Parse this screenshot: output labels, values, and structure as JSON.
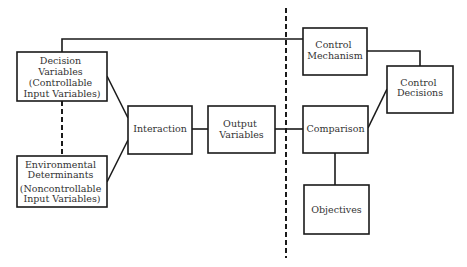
{
  "diagram": {
    "type": "block-diagram",
    "colors": {
      "line": "#1a1a1a",
      "text": "#333333",
      "background": "#ffffff"
    },
    "nodes": {
      "decision_variables": {
        "lines": [
          "Decision",
          "Variables",
          "(Controllable",
          "Input Variables)"
        ]
      },
      "environmental_determinants": {
        "lines": [
          "Environmental",
          "Determinants",
          "(Noncontrollable",
          "Input Variables)"
        ]
      },
      "interaction": {
        "lines": [
          "Interaction"
        ]
      },
      "output_variables": {
        "lines": [
          "Output",
          "Variables"
        ]
      },
      "control_mechanism": {
        "lines": [
          "Control",
          "Mechanism"
        ]
      },
      "control_decisions": {
        "lines": [
          "Control",
          "Decisions"
        ]
      },
      "comparison": {
        "lines": [
          "Comparison"
        ]
      },
      "objectives": {
        "lines": [
          "Objectives"
        ]
      }
    },
    "edges": [
      {
        "from": "decision_variables",
        "to": "control_mechanism",
        "style": "solid"
      },
      {
        "from": "decision_variables",
        "to": "environmental_determinants",
        "style": "dashed"
      },
      {
        "from": "decision_variables",
        "to": "interaction",
        "style": "solid"
      },
      {
        "from": "environmental_determinants",
        "to": "interaction",
        "style": "solid"
      },
      {
        "from": "interaction",
        "to": "output_variables",
        "style": "solid"
      },
      {
        "from": "output_variables",
        "to": "comparison",
        "style": "solid"
      },
      {
        "from": "comparison",
        "to": "objectives",
        "style": "solid"
      },
      {
        "from": "comparison",
        "to": "control_decisions",
        "style": "solid"
      },
      {
        "from": "control_mechanism",
        "to": "control_decisions",
        "style": "solid"
      }
    ],
    "boundary": {
      "style": "dashed",
      "orientation": "vertical"
    }
  }
}
